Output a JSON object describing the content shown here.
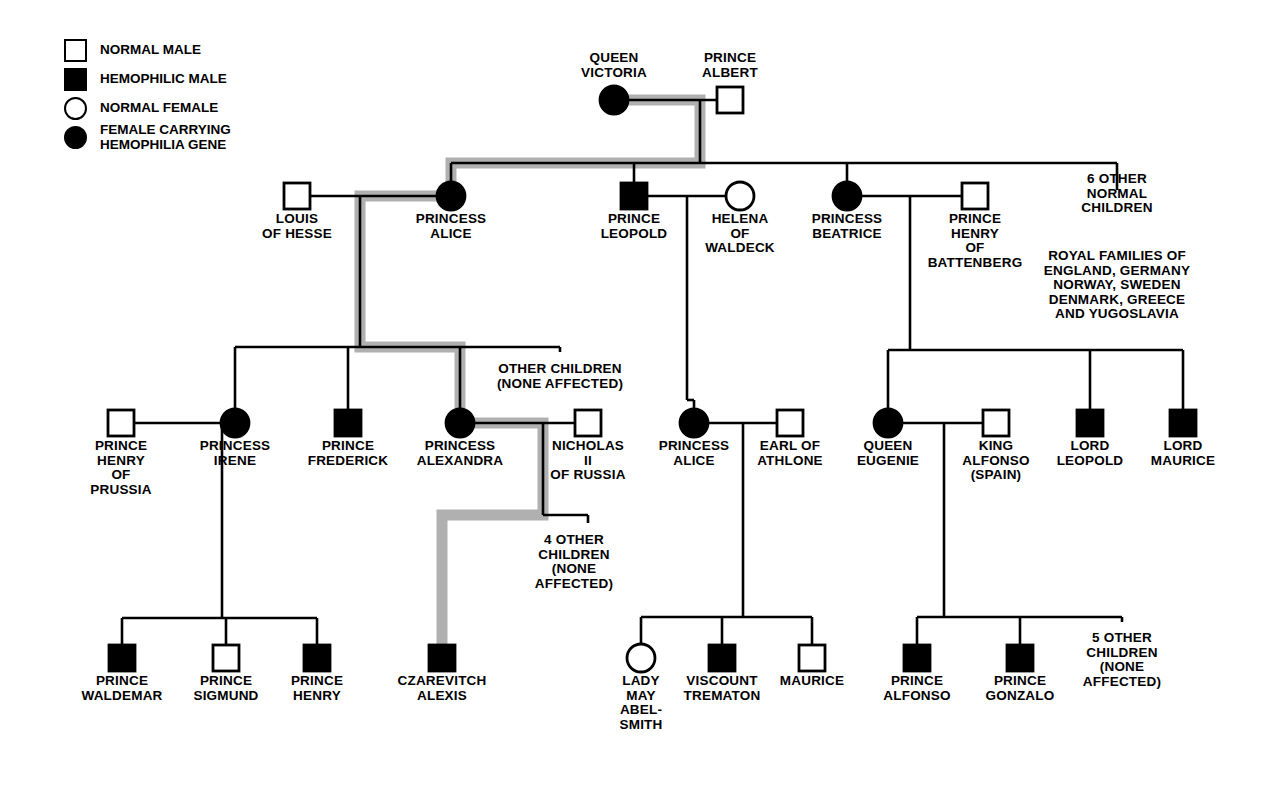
{
  "colors": {
    "line": "#000000",
    "highlight": "#b0b0b0",
    "fill_affected": "#000000",
    "fill_normal": "#ffffff",
    "background": "#ffffff"
  },
  "legend": {
    "items": [
      {
        "symbol": "square-open",
        "label": "NORMAL MALE"
      },
      {
        "symbol": "square-filled",
        "label": "HEMOPHILIC MALE"
      },
      {
        "symbol": "circle-open",
        "label": "NORMAL FEMALE"
      },
      {
        "symbol": "circle-filled",
        "label": "FEMALE CARRYING\nHEMOPHILIA GENE"
      }
    ]
  },
  "chart_data": {
    "type": "diagram",
    "subtype": "pedigree",
    "generations": 4,
    "highlight_path_meaning": "transmission of the hemophilia gene from Queen Victoria to Czarevitch Alexis",
    "symbol_key": {
      "square-open": "normal male",
      "square-filled": "hemophilic male",
      "circle-open": "normal female",
      "circle-filled": "female carrying hemophilia gene"
    },
    "individuals": [
      {
        "id": "victoria",
        "label": "QUEEN\nVICTORIA",
        "symbol": "circle-filled",
        "generation": 1,
        "x": 614,
        "y": 100,
        "label_pos": "top"
      },
      {
        "id": "albert",
        "label": "PRINCE\nALBERT",
        "symbol": "square-open",
        "generation": 1,
        "x": 730,
        "y": 100,
        "label_pos": "top"
      },
      {
        "id": "louis",
        "label": "LOUIS\nOF HESSE",
        "symbol": "square-open",
        "generation": 2,
        "x": 297,
        "y": 196,
        "label_pos": "bottom"
      },
      {
        "id": "alice1",
        "label": "PRINCESS\nALICE",
        "symbol": "circle-filled",
        "generation": 2,
        "x": 451,
        "y": 196,
        "label_pos": "bottom"
      },
      {
        "id": "leopold",
        "label": "PRINCE\nLEOPOLD",
        "symbol": "square-filled",
        "generation": 2,
        "x": 634,
        "y": 196,
        "label_pos": "bottom"
      },
      {
        "id": "helena",
        "label": "HELENA\nOF\nWALDECK",
        "symbol": "circle-open",
        "generation": 2,
        "x": 740,
        "y": 196,
        "label_pos": "bottom"
      },
      {
        "id": "beatrice",
        "label": "PRINCESS\nBEATRICE",
        "symbol": "circle-filled",
        "generation": 2,
        "x": 847,
        "y": 196,
        "label_pos": "bottom"
      },
      {
        "id": "henrybatt",
        "label": "PRINCE\nHENRY\nOF\nBATTENBERG",
        "symbol": "square-open",
        "generation": 2,
        "x": 975,
        "y": 196,
        "label_pos": "bottom"
      },
      {
        "id": "henrypru",
        "label": "PRINCE\nHENRY\nOF\nPRUSSIA",
        "symbol": "square-open",
        "generation": 3,
        "x": 121,
        "y": 423,
        "label_pos": "bottom"
      },
      {
        "id": "irene",
        "label": "PRINCESS\nIRENE",
        "symbol": "circle-filled",
        "generation": 3,
        "x": 235,
        "y": 423,
        "label_pos": "bottom"
      },
      {
        "id": "frederick",
        "label": "PRINCE\nFREDERICK",
        "symbol": "square-filled",
        "generation": 3,
        "x": 348,
        "y": 423,
        "label_pos": "bottom"
      },
      {
        "id": "alexandra",
        "label": "PRINCESS\nALEXANDRA",
        "symbol": "circle-filled",
        "generation": 3,
        "x": 460,
        "y": 423,
        "label_pos": "bottom"
      },
      {
        "id": "nicholas",
        "label": "NICHOLAS\nII\nOF RUSSIA",
        "symbol": "square-open",
        "generation": 3,
        "x": 588,
        "y": 423,
        "label_pos": "bottom"
      },
      {
        "id": "alice2",
        "label": "PRINCESS\nALICE",
        "symbol": "circle-filled",
        "generation": 3,
        "x": 694,
        "y": 423,
        "label_pos": "bottom"
      },
      {
        "id": "athlone",
        "label": "EARL OF\nATHLONE",
        "symbol": "square-open",
        "generation": 3,
        "x": 790,
        "y": 423,
        "label_pos": "bottom"
      },
      {
        "id": "eugenie",
        "label": "QUEEN\nEUGENIE",
        "symbol": "circle-filled",
        "generation": 3,
        "x": 888,
        "y": 423,
        "label_pos": "bottom"
      },
      {
        "id": "alfonso13",
        "label": "KING\nALFONSO\n(SPAIN)",
        "symbol": "square-open",
        "generation": 3,
        "x": 996,
        "y": 423,
        "label_pos": "bottom"
      },
      {
        "id": "lordleo",
        "label": "LORD\nLEOPOLD",
        "symbol": "square-filled",
        "generation": 3,
        "x": 1090,
        "y": 423,
        "label_pos": "bottom"
      },
      {
        "id": "lordmau",
        "label": "LORD\nMAURICE",
        "symbol": "square-filled",
        "generation": 3,
        "x": 1183,
        "y": 423,
        "label_pos": "bottom"
      },
      {
        "id": "waldemar",
        "label": "PRINCE\nWALDEMAR",
        "symbol": "square-filled",
        "generation": 4,
        "x": 122,
        "y": 658,
        "label_pos": "bottom"
      },
      {
        "id": "sigmund",
        "label": "PRINCE\nSIGMUND",
        "symbol": "square-open",
        "generation": 4,
        "x": 226,
        "y": 658,
        "label_pos": "bottom"
      },
      {
        "id": "henry4",
        "label": "PRINCE\nHENRY",
        "symbol": "square-filled",
        "generation": 4,
        "x": 317,
        "y": 658,
        "label_pos": "bottom"
      },
      {
        "id": "alexis",
        "label": "CZAREVITCH\nALEXIS",
        "symbol": "square-filled",
        "generation": 4,
        "x": 442,
        "y": 658,
        "label_pos": "bottom"
      },
      {
        "id": "ladymay",
        "label": "LADY\nMAY\nABEL-\nSMITH",
        "symbol": "circle-open",
        "generation": 4,
        "x": 641,
        "y": 658,
        "label_pos": "bottom"
      },
      {
        "id": "trematon",
        "label": "VISCOUNT\nTREMATON",
        "symbol": "square-filled",
        "generation": 4,
        "x": 722,
        "y": 658,
        "label_pos": "bottom"
      },
      {
        "id": "maurice4",
        "label": "MAURICE",
        "symbol": "square-open",
        "generation": 4,
        "x": 812,
        "y": 658,
        "label_pos": "bottom"
      },
      {
        "id": "alfonso",
        "label": "PRINCE\nALFONSO",
        "symbol": "square-filled",
        "generation": 4,
        "x": 917,
        "y": 658,
        "label_pos": "bottom"
      },
      {
        "id": "gonzalo",
        "label": "PRINCE\nGONZALO",
        "symbol": "square-filled",
        "generation": 4,
        "x": 1020,
        "y": 658,
        "label_pos": "bottom"
      }
    ],
    "annotations": [
      {
        "id": "six-other",
        "text": "6 OTHER\nNORMAL\nCHILDREN",
        "x": 1117,
        "y": 172
      },
      {
        "id": "royal-families",
        "text": "ROYAL FAMILIES OF\nENGLAND, GERMANY\nNORWAY, SWEDEN\nDENMARK, GREECE\nAND YUGOSLAVIA",
        "x": 1117,
        "y": 249
      },
      {
        "id": "other-children",
        "text": "OTHER CHILDREN\n(NONE AFFECTED)",
        "x": 560,
        "y": 362
      },
      {
        "id": "four-other",
        "text": "4 OTHER\nCHILDREN\n(NONE\nAFFECTED)",
        "x": 574,
        "y": 533
      },
      {
        "id": "five-other",
        "text": "5 OTHER\nCHILDREN\n(NONE\nAFFECTED)",
        "x": 1122,
        "y": 631
      }
    ],
    "unions": [
      {
        "partners": [
          "victoria",
          "albert"
        ],
        "children": [
          "alice1",
          "leopold",
          "beatrice",
          "six-other"
        ]
      },
      {
        "partners": [
          "louis",
          "alice1"
        ],
        "children": [
          "irene",
          "frederick",
          "alexandra",
          "other-children"
        ]
      },
      {
        "partners": [
          "leopold",
          "helena"
        ],
        "children": [
          "alice2"
        ]
      },
      {
        "partners": [
          "beatrice",
          "henrybatt"
        ],
        "children": [
          "eugenie",
          "lordleo",
          "lordmau"
        ]
      },
      {
        "partners": [
          "henrypru",
          "irene"
        ],
        "children": [
          "waldemar",
          "sigmund",
          "henry4"
        ]
      },
      {
        "partners": [
          "alexandra",
          "nicholas"
        ],
        "children": [
          "alexis",
          "four-other"
        ]
      },
      {
        "partners": [
          "alice2",
          "athlone"
        ],
        "children": [
          "ladymay",
          "trematon",
          "maurice4"
        ]
      },
      {
        "partners": [
          "eugenie",
          "alfonso13"
        ],
        "children": [
          "alfonso",
          "gonzalo",
          "five-other"
        ]
      }
    ]
  }
}
